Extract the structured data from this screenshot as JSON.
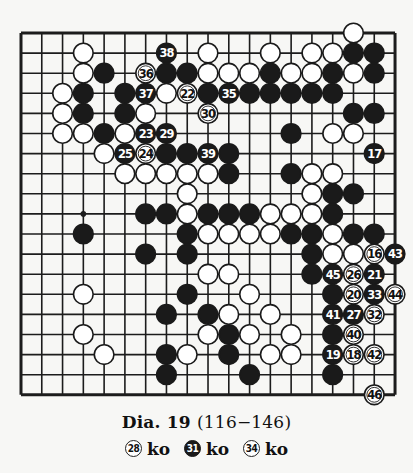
{
  "diagram": {
    "board_size": 19,
    "grid": {
      "x0": 21,
      "y0": 33,
      "dx": 20.78,
      "dy": 20.1
    },
    "colors": {
      "line": "#1c1c1c",
      "black_stone": "#1a1a1a",
      "white_stone": "#ffffff",
      "background": "#f7f7f5"
    },
    "star_points": [
      {
        "col": 3,
        "row": 9
      }
    ],
    "stones": [
      {
        "col": 16,
        "row": 0,
        "color": "white"
      },
      {
        "col": 3,
        "row": 1,
        "color": "white"
      },
      {
        "col": 7,
        "row": 1,
        "color": "black",
        "label": "38"
      },
      {
        "col": 9,
        "row": 1,
        "color": "white"
      },
      {
        "col": 12,
        "row": 1,
        "color": "white"
      },
      {
        "col": 14,
        "row": 1,
        "color": "white"
      },
      {
        "col": 15,
        "row": 1,
        "color": "white"
      },
      {
        "col": 16,
        "row": 1,
        "color": "black"
      },
      {
        "col": 17,
        "row": 1,
        "color": "black"
      },
      {
        "col": 3,
        "row": 2,
        "color": "white"
      },
      {
        "col": 4,
        "row": 2,
        "color": "black"
      },
      {
        "col": 6,
        "row": 2,
        "color": "white",
        "label": "36"
      },
      {
        "col": 7,
        "row": 2,
        "color": "black"
      },
      {
        "col": 8,
        "row": 2,
        "color": "black"
      },
      {
        "col": 9,
        "row": 2,
        "color": "white"
      },
      {
        "col": 10,
        "row": 2,
        "color": "white"
      },
      {
        "col": 11,
        "row": 2,
        "color": "white"
      },
      {
        "col": 12,
        "row": 2,
        "color": "black"
      },
      {
        "col": 13,
        "row": 2,
        "color": "white"
      },
      {
        "col": 14,
        "row": 2,
        "color": "white"
      },
      {
        "col": 15,
        "row": 2,
        "color": "black"
      },
      {
        "col": 16,
        "row": 2,
        "color": "white"
      },
      {
        "col": 17,
        "row": 2,
        "color": "black"
      },
      {
        "col": 2,
        "row": 3,
        "color": "white"
      },
      {
        "col": 3,
        "row": 3,
        "color": "black"
      },
      {
        "col": 5,
        "row": 3,
        "color": "black"
      },
      {
        "col": 6,
        "row": 3,
        "color": "black",
        "label": "37"
      },
      {
        "col": 7,
        "row": 3,
        "color": "white"
      },
      {
        "col": 8,
        "row": 3,
        "color": "white",
        "label": "22"
      },
      {
        "col": 9,
        "row": 3,
        "color": "black"
      },
      {
        "col": 10,
        "row": 3,
        "color": "black",
        "label": "35"
      },
      {
        "col": 11,
        "row": 3,
        "color": "black"
      },
      {
        "col": 12,
        "row": 3,
        "color": "black"
      },
      {
        "col": 13,
        "row": 3,
        "color": "black"
      },
      {
        "col": 14,
        "row": 3,
        "color": "black"
      },
      {
        "col": 15,
        "row": 3,
        "color": "black"
      },
      {
        "col": 2,
        "row": 4,
        "color": "white"
      },
      {
        "col": 3,
        "row": 4,
        "color": "black"
      },
      {
        "col": 5,
        "row": 4,
        "color": "black"
      },
      {
        "col": 6,
        "row": 4,
        "color": "white"
      },
      {
        "col": 9,
        "row": 4,
        "color": "white",
        "label": "30"
      },
      {
        "col": 16,
        "row": 4,
        "color": "black"
      },
      {
        "col": 17,
        "row": 4,
        "color": "black"
      },
      {
        "col": 2,
        "row": 5,
        "color": "white"
      },
      {
        "col": 3,
        "row": 5,
        "color": "white"
      },
      {
        "col": 4,
        "row": 5,
        "color": "black"
      },
      {
        "col": 5,
        "row": 5,
        "color": "white"
      },
      {
        "col": 6,
        "row": 5,
        "color": "black",
        "label": "23"
      },
      {
        "col": 7,
        "row": 5,
        "color": "black",
        "label": "29"
      },
      {
        "col": 13,
        "row": 5,
        "color": "black"
      },
      {
        "col": 15,
        "row": 5,
        "color": "white"
      },
      {
        "col": 16,
        "row": 5,
        "color": "white"
      },
      {
        "col": 4,
        "row": 6,
        "color": "white"
      },
      {
        "col": 5,
        "row": 6,
        "color": "black",
        "label": "25"
      },
      {
        "col": 6,
        "row": 6,
        "color": "white",
        "label": "24"
      },
      {
        "col": 7,
        "row": 6,
        "color": "black"
      },
      {
        "col": 8,
        "row": 6,
        "color": "black"
      },
      {
        "col": 9,
        "row": 6,
        "color": "black",
        "label": "39"
      },
      {
        "col": 10,
        "row": 6,
        "color": "black"
      },
      {
        "col": 17,
        "row": 6,
        "color": "black",
        "label": "17"
      },
      {
        "col": 5,
        "row": 7,
        "color": "white"
      },
      {
        "col": 6,
        "row": 7,
        "color": "white"
      },
      {
        "col": 7,
        "row": 7,
        "color": "white"
      },
      {
        "col": 8,
        "row": 7,
        "color": "white"
      },
      {
        "col": 9,
        "row": 7,
        "color": "white"
      },
      {
        "col": 10,
        "row": 7,
        "color": "black"
      },
      {
        "col": 13,
        "row": 7,
        "color": "black"
      },
      {
        "col": 14,
        "row": 7,
        "color": "white"
      },
      {
        "col": 15,
        "row": 7,
        "color": "white"
      },
      {
        "col": 8,
        "row": 8,
        "color": "white"
      },
      {
        "col": 14,
        "row": 8,
        "color": "white"
      },
      {
        "col": 15,
        "row": 8,
        "color": "black"
      },
      {
        "col": 16,
        "row": 8,
        "color": "black"
      },
      {
        "col": 6,
        "row": 9,
        "color": "black"
      },
      {
        "col": 7,
        "row": 9,
        "color": "black"
      },
      {
        "col": 8,
        "row": 9,
        "color": "white"
      },
      {
        "col": 9,
        "row": 9,
        "color": "black"
      },
      {
        "col": 10,
        "row": 9,
        "color": "black"
      },
      {
        "col": 11,
        "row": 9,
        "color": "black"
      },
      {
        "col": 12,
        "row": 9,
        "color": "white"
      },
      {
        "col": 13,
        "row": 9,
        "color": "white"
      },
      {
        "col": 14,
        "row": 9,
        "color": "white"
      },
      {
        "col": 15,
        "row": 9,
        "color": "black"
      },
      {
        "col": 3,
        "row": 10,
        "color": "black"
      },
      {
        "col": 8,
        "row": 10,
        "color": "black"
      },
      {
        "col": 9,
        "row": 10,
        "color": "white"
      },
      {
        "col": 10,
        "row": 10,
        "color": "white"
      },
      {
        "col": 11,
        "row": 10,
        "color": "white"
      },
      {
        "col": 12,
        "row": 10,
        "color": "white"
      },
      {
        "col": 13,
        "row": 10,
        "color": "black"
      },
      {
        "col": 14,
        "row": 10,
        "color": "black"
      },
      {
        "col": 15,
        "row": 10,
        "color": "white"
      },
      {
        "col": 16,
        "row": 10,
        "color": "black"
      },
      {
        "col": 17,
        "row": 10,
        "color": "black"
      },
      {
        "col": 6,
        "row": 11,
        "color": "black"
      },
      {
        "col": 8,
        "row": 11,
        "color": "black"
      },
      {
        "col": 14,
        "row": 11,
        "color": "black"
      },
      {
        "col": 15,
        "row": 11,
        "color": "white"
      },
      {
        "col": 16,
        "row": 11,
        "color": "white"
      },
      {
        "col": 17,
        "row": 11,
        "color": "white",
        "label": "16"
      },
      {
        "col": 18,
        "row": 11,
        "color": "black",
        "label": "43"
      },
      {
        "col": 9,
        "row": 12,
        "color": "white"
      },
      {
        "col": 10,
        "row": 12,
        "color": "white"
      },
      {
        "col": 14,
        "row": 12,
        "color": "black"
      },
      {
        "col": 15,
        "row": 12,
        "color": "black",
        "label": "45"
      },
      {
        "col": 16,
        "row": 12,
        "color": "white",
        "label": "26"
      },
      {
        "col": 17,
        "row": 12,
        "color": "black",
        "label": "21"
      },
      {
        "col": 3,
        "row": 13,
        "color": "white"
      },
      {
        "col": 8,
        "row": 13,
        "color": "black"
      },
      {
        "col": 11,
        "row": 13,
        "color": "white"
      },
      {
        "col": 15,
        "row": 13,
        "color": "black"
      },
      {
        "col": 16,
        "row": 13,
        "color": "white",
        "label": "20"
      },
      {
        "col": 17,
        "row": 13,
        "color": "black",
        "label": "33"
      },
      {
        "col": 18,
        "row": 13,
        "color": "white",
        "label": "44"
      },
      {
        "col": 7,
        "row": 14,
        "color": "black"
      },
      {
        "col": 9,
        "row": 14,
        "color": "black"
      },
      {
        "col": 10,
        "row": 14,
        "color": "white"
      },
      {
        "col": 12,
        "row": 14,
        "color": "white"
      },
      {
        "col": 15,
        "row": 14,
        "color": "black",
        "label": "41"
      },
      {
        "col": 16,
        "row": 14,
        "color": "black",
        "label": "27"
      },
      {
        "col": 17,
        "row": 14,
        "color": "white",
        "label": "32"
      },
      {
        "col": 3,
        "row": 15,
        "color": "white"
      },
      {
        "col": 9,
        "row": 15,
        "color": "white"
      },
      {
        "col": 10,
        "row": 15,
        "color": "black"
      },
      {
        "col": 11,
        "row": 15,
        "color": "white"
      },
      {
        "col": 13,
        "row": 15,
        "color": "white"
      },
      {
        "col": 15,
        "row": 15,
        "color": "black"
      },
      {
        "col": 16,
        "row": 15,
        "color": "white",
        "label": "40"
      },
      {
        "col": 4,
        "row": 16,
        "color": "white"
      },
      {
        "col": 7,
        "row": 16,
        "color": "black"
      },
      {
        "col": 8,
        "row": 16,
        "color": "white"
      },
      {
        "col": 10,
        "row": 16,
        "color": "black"
      },
      {
        "col": 12,
        "row": 16,
        "color": "white"
      },
      {
        "col": 13,
        "row": 16,
        "color": "white"
      },
      {
        "col": 15,
        "row": 16,
        "color": "black",
        "label": "19"
      },
      {
        "col": 16,
        "row": 16,
        "color": "white",
        "label": "18"
      },
      {
        "col": 17,
        "row": 16,
        "color": "white",
        "label": "42"
      },
      {
        "col": 7,
        "row": 17,
        "color": "black"
      },
      {
        "col": 11,
        "row": 17,
        "color": "black"
      },
      {
        "col": 15,
        "row": 17,
        "color": "black"
      },
      {
        "col": 17,
        "row": 18,
        "color": "white",
        "label": "46"
      }
    ]
  },
  "caption": {
    "title": "Dia. 19",
    "range": "(116−146)",
    "ko_notes": [
      {
        "move": "28",
        "color": "white",
        "text": "ko"
      },
      {
        "move": "31",
        "color": "black",
        "text": "ko"
      },
      {
        "move": "34",
        "color": "white",
        "text": "ko"
      }
    ]
  }
}
